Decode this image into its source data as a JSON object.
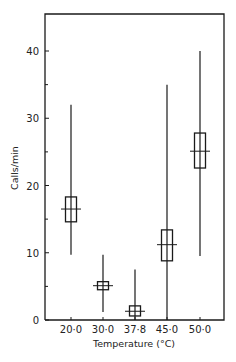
{
  "chart_data": {
    "type": "box",
    "title": "",
    "xlabel": "Temperature (°C)",
    "ylabel": "Calls/min",
    "ylim": [
      0,
      45
    ],
    "yticks_major": [
      0,
      10,
      20,
      30,
      40
    ],
    "yticks_minor": [
      5,
      15,
      25,
      35
    ],
    "ytick_labels": [
      "0",
      "10",
      "20",
      "30",
      "40"
    ],
    "categories": [
      "20·0",
      "30·0",
      "37·8",
      "45·0",
      "50·0"
    ],
    "grid": false,
    "legend": "none",
    "series": [
      {
        "name": "20·0",
        "min": 9.7,
        "max": 32,
        "box_low": 14.6,
        "box_high": 18.3,
        "mean": 16.5
      },
      {
        "name": "30·0",
        "min": 1.2,
        "max": 9.7,
        "box_low": 4.5,
        "box_high": 5.7,
        "mean": 5.1
      },
      {
        "name": "37·8",
        "min": 0,
        "max": 7.5,
        "box_low": 0.6,
        "box_high": 2.1,
        "mean": 1.3
      },
      {
        "name": "45·0",
        "min": 0,
        "max": 35,
        "box_low": 8.8,
        "box_high": 13.4,
        "mean": 11.2
      },
      {
        "name": "50·0",
        "min": 9.5,
        "max": 40,
        "box_low": 22.6,
        "box_high": 27.8,
        "mean": 25.1
      }
    ]
  }
}
